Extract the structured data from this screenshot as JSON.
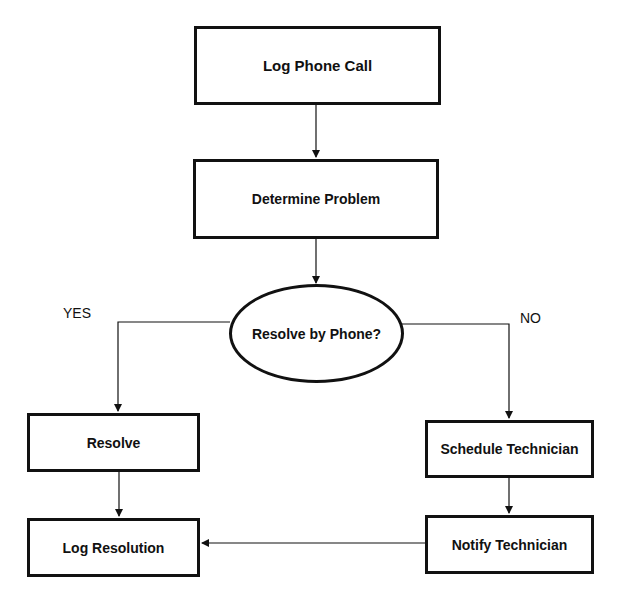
{
  "flowchart": {
    "nodes": [
      {
        "id": "log-call",
        "label": "Log Phone Call",
        "shape": "rectangle"
      },
      {
        "id": "determine",
        "label": "Determine Problem",
        "shape": "rectangle"
      },
      {
        "id": "decision",
        "label": "Resolve by Phone?",
        "shape": "ellipse"
      },
      {
        "id": "resolve",
        "label": "Resolve",
        "shape": "rectangle"
      },
      {
        "id": "log-resolution",
        "label": "Log Resolution",
        "shape": "rectangle"
      },
      {
        "id": "schedule",
        "label": "Schedule Technician",
        "shape": "rectangle"
      },
      {
        "id": "notify",
        "label": "Notify Technician",
        "shape": "rectangle"
      }
    ],
    "branch_labels": {
      "yes": "YES",
      "no": "NO"
    },
    "edges": [
      {
        "from": "log-call",
        "to": "determine"
      },
      {
        "from": "determine",
        "to": "decision"
      },
      {
        "from": "decision",
        "to": "resolve",
        "label": "YES"
      },
      {
        "from": "decision",
        "to": "schedule",
        "label": "NO"
      },
      {
        "from": "resolve",
        "to": "log-resolution"
      },
      {
        "from": "schedule",
        "to": "notify"
      },
      {
        "from": "notify",
        "to": "log-resolution"
      }
    ]
  }
}
